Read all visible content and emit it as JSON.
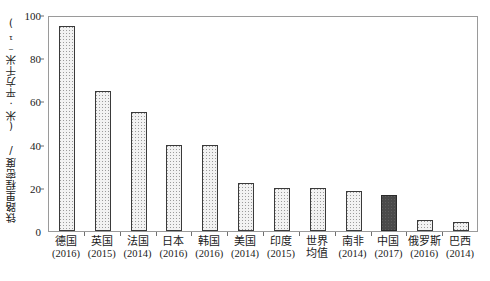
{
  "chart_data": {
    "type": "bar",
    "title": "",
    "subtitle": "",
    "xlabel": "",
    "ylabel": "铁路里程密度/ (米·平方千米⁻¹)",
    "ylim": [
      0,
      100
    ],
    "ytick_labels": [
      "0",
      "20",
      "40",
      "60",
      "80",
      "100"
    ],
    "ytick_values": [
      0,
      20,
      40,
      60,
      80,
      100
    ],
    "grid": false,
    "legend": "none",
    "categories": [
      "德国",
      "英国",
      "法国",
      "日本",
      "韩国",
      "美国",
      "印度",
      "世界均值",
      "南非",
      "中国",
      "俄罗斯",
      "巴西"
    ],
    "category_years": [
      "(2016)",
      "(2015)",
      "(2014)",
      "(2016)",
      "(2016)",
      "(2014)",
      "(2015)",
      "",
      "(2014)",
      "(2017)",
      "(2016)",
      "(2014)"
    ],
    "category_lines": [
      [
        "德国",
        "(2016)"
      ],
      [
        "英国",
        "(2015)"
      ],
      [
        "法国",
        "(2014)"
      ],
      [
        "日本",
        "(2016)"
      ],
      [
        "韩国",
        "(2016)"
      ],
      [
        "美国",
        "(2014)"
      ],
      [
        "印度",
        "(2015)"
      ],
      [
        "世界",
        "均值"
      ],
      [
        "南非",
        "(2014)"
      ],
      [
        "中国",
        "(2017)"
      ],
      [
        "俄罗斯",
        "(2016)"
      ],
      [
        "巴西",
        "(2014)"
      ]
    ],
    "values": [
      95,
      65,
      55,
      40,
      40,
      22,
      20,
      20,
      18.5,
      16.5,
      5,
      4
    ],
    "highlight_index": 9,
    "colors": {
      "bar_fill": "#f2f2f2",
      "bar_pattern": "#9b9b9b",
      "bar_border": "#3a3a3a",
      "highlight_fill": "#4a4a4a",
      "highlight_border": "#2a2a2a",
      "frame": "#9a9a9a",
      "text": "#1a1a1a"
    }
  }
}
